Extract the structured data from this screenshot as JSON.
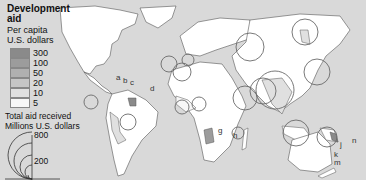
{
  "legend": {
    "title_line1": "Development",
    "title_line2": "aid",
    "subtitle_line1": "Per capita",
    "subtitle_line2": "U.S. dollars",
    "classes": [
      {
        "label": "300",
        "color": "#8a8a8a"
      },
      {
        "label": "100",
        "color": "#9c9c9c"
      },
      {
        "label": "50",
        "color": "#b0b0b0"
      },
      {
        "label": "20",
        "color": "#c6c6c6"
      },
      {
        "label": "10",
        "color": "#e0e0e0"
      },
      {
        "label": "5",
        "color": "#f7f7f7"
      }
    ],
    "total_line1": "Total aid received",
    "total_line2": "Millions U.S. dollars",
    "scale": [
      {
        "label": "800"
      },
      {
        "label": "200"
      }
    ]
  },
  "map_labels": [
    {
      "text": "a",
      "x": 116,
      "y": 73
    },
    {
      "text": "b",
      "x": 123,
      "y": 76
    },
    {
      "text": "c",
      "x": 130,
      "y": 78
    },
    {
      "text": "d",
      "x": 150,
      "y": 84
    },
    {
      "text": "g",
      "x": 218,
      "y": 126
    },
    {
      "text": "h",
      "x": 233,
      "y": 131
    },
    {
      "text": "j",
      "x": 340,
      "y": 140
    },
    {
      "text": "k",
      "x": 334,
      "y": 150
    },
    {
      "text": "m",
      "x": 334,
      "y": 158
    },
    {
      "text": "n",
      "x": 352,
      "y": 136
    }
  ],
  "colors": {
    "ocean": "#d9d9d9",
    "land": "#ffffff",
    "outline": "#555555",
    "circle": "#6a6a6a"
  }
}
